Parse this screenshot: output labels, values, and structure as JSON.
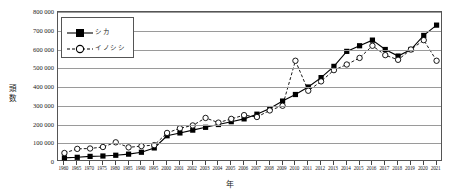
{
  "chart_data": {
    "type": "line",
    "title": "",
    "xlabel": "年",
    "ylabel": "頭数",
    "ylim": [
      0,
      800000
    ],
    "ytick_values": [
      0,
      100000,
      200000,
      300000,
      400000,
      500000,
      600000,
      700000,
      800000
    ],
    "ytick_labels": [
      "0",
      "100 000",
      "200 000",
      "300 000",
      "400 000",
      "500 000",
      "600 000",
      "700 000",
      "800 000"
    ],
    "grid": true,
    "legend_position": "upper-left",
    "categories": [
      "1960",
      "1965",
      "1970",
      "1975",
      "1980",
      "1985",
      "1990",
      "1995",
      "2000",
      "2001",
      "2002",
      "2003",
      "2004",
      "2005",
      "2006",
      "2007",
      "2008",
      "2009",
      "2010",
      "2011",
      "2012",
      "2013",
      "2014",
      "2015",
      "2016",
      "2017",
      "2018",
      "2019",
      "2020",
      "2021"
    ],
    "series": [
      {
        "name": "シカ",
        "marker": "filled-square",
        "line": "solid",
        "color": "#000000",
        "values": [
          22000,
          25000,
          30000,
          32000,
          36000,
          42000,
          52000,
          75000,
          140000,
          155000,
          170000,
          185000,
          200000,
          215000,
          230000,
          255000,
          285000,
          325000,
          360000,
          400000,
          450000,
          510000,
          590000,
          620000,
          650000,
          600000,
          565000,
          600000,
          675000,
          730000
        ]
      },
      {
        "name": "イノシシ",
        "marker": "open-circle",
        "line": "dashed",
        "color": "#000000",
        "values": [
          48000,
          70000,
          72000,
          80000,
          105000,
          78000,
          85000,
          90000,
          155000,
          180000,
          195000,
          235000,
          210000,
          230000,
          250000,
          240000,
          275000,
          300000,
          540000,
          380000,
          430000,
          490000,
          520000,
          555000,
          620000,
          570000,
          545000,
          600000,
          650000,
          540000
        ]
      }
    ]
  }
}
